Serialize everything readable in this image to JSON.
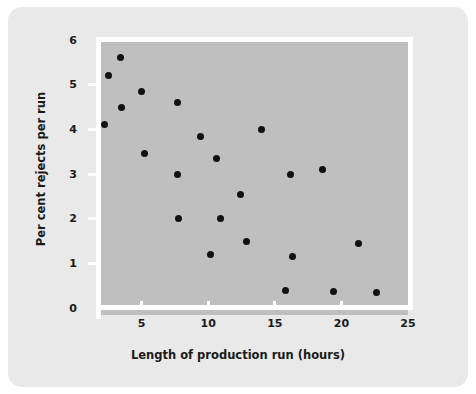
{
  "chart_data": {
    "type": "scatter",
    "title": "",
    "xlabel": "Length of production run (hours)",
    "ylabel": "Per cent rejects per run",
    "xlim": [
      0,
      25
    ],
    "ylim": [
      0,
      6
    ],
    "xticks": [
      5,
      10,
      15,
      20,
      25
    ],
    "yticks": [
      0,
      1,
      2,
      3,
      4,
      5,
      6
    ],
    "grid": false,
    "legend": null,
    "marker": {
      "shape": "circle",
      "color": "#111111",
      "size": 7
    },
    "points": [
      {
        "x": 2.2,
        "y": 4.1
      },
      {
        "x": 2.5,
        "y": 5.2
      },
      {
        "x": 3.4,
        "y": 5.6
      },
      {
        "x": 3.5,
        "y": 4.5
      },
      {
        "x": 5.0,
        "y": 4.85
      },
      {
        "x": 5.2,
        "y": 3.45
      },
      {
        "x": 7.7,
        "y": 4.6
      },
      {
        "x": 7.7,
        "y": 3.0
      },
      {
        "x": 7.8,
        "y": 2.0
      },
      {
        "x": 9.4,
        "y": 3.85
      },
      {
        "x": 10.2,
        "y": 1.2
      },
      {
        "x": 10.6,
        "y": 3.35
      },
      {
        "x": 10.9,
        "y": 2.0
      },
      {
        "x": 12.4,
        "y": 2.55
      },
      {
        "x": 12.9,
        "y": 1.5
      },
      {
        "x": 14.0,
        "y": 4.0
      },
      {
        "x": 15.8,
        "y": 0.4
      },
      {
        "x": 16.2,
        "y": 3.0
      },
      {
        "x": 16.3,
        "y": 1.15
      },
      {
        "x": 18.6,
        "y": 3.1
      },
      {
        "x": 19.4,
        "y": 0.38
      },
      {
        "x": 21.3,
        "y": 1.45
      },
      {
        "x": 22.6,
        "y": 0.35
      }
    ]
  },
  "colors": {
    "panel_background": "#e9e9e9",
    "plot_background": "#bfbfbf",
    "axis_line": "#ffffff",
    "marker": "#111111",
    "text": "#1a1a1a"
  }
}
